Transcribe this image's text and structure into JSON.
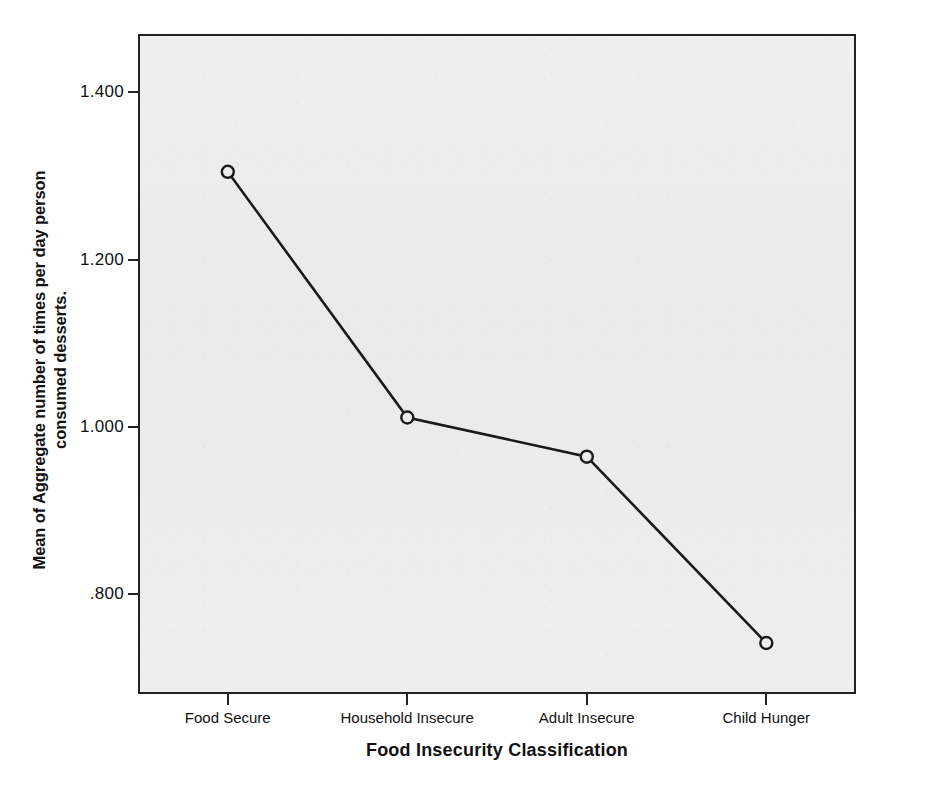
{
  "figure": {
    "cropped_caption_fragment": "",
    "background_color": "#ececec",
    "frame_color": "#222222",
    "line_color": "#1a1a1a"
  },
  "chart_data": {
    "type": "line",
    "title": "",
    "xlabel": "Food Insecurity Classification",
    "ylabel": "Mean of Aggregate number of times per day person consumed desserts.",
    "ylabel_line1": "Mean of Aggregate number of times per day person",
    "ylabel_line2": "consumed desserts.",
    "categories": [
      "Food Secure",
      "Household Insecure",
      "Adult Insecure",
      "Child Hunger"
    ],
    "values": [
      1.305,
      1.011,
      0.964,
      0.741
    ],
    "ytick_labels": [
      "1.400",
      "1.200",
      "1.000",
      ".800"
    ],
    "ytick_values": [
      1.4,
      1.2,
      1.0,
      0.8
    ],
    "ylim": [
      0.68,
      1.47
    ],
    "grid": false,
    "legend": "none",
    "marker": "open-circle",
    "series": [
      {
        "name": "Mean desserts per day",
        "values": [
          1.305,
          1.011,
          0.964,
          0.741
        ]
      }
    ]
  },
  "axis": {
    "y_ticks": [
      {
        "label": "1.400",
        "value": 1.4
      },
      {
        "label": "1.200",
        "value": 1.2
      },
      {
        "label": "1.000",
        "value": 1.0
      },
      {
        "label": ".800",
        "value": 0.8
      }
    ],
    "x_ticks": [
      {
        "label": "Food Secure"
      },
      {
        "label": "Household Insecure"
      },
      {
        "label": "Adult Insecure"
      },
      {
        "label": "Child Hunger"
      }
    ]
  }
}
